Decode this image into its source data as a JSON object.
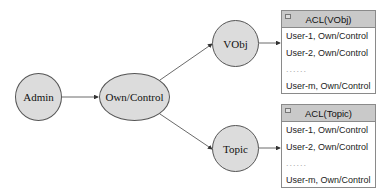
{
  "diagram": {
    "nodes": {
      "admin": "Admin",
      "own_control": "Own/Control",
      "vobj": "VObj",
      "topic": "Topic"
    },
    "edges": [
      {
        "from": "Admin",
        "to": "Own/Control"
      },
      {
        "from": "Own/Control",
        "to": "VObj"
      },
      {
        "from": "Own/Control",
        "to": "Topic"
      },
      {
        "from": "VObj",
        "to": "ACL(VObj)"
      },
      {
        "from": "Topic",
        "to": "ACL(Topic)"
      }
    ],
    "acl_vobj": {
      "title": "ACL(VObj)",
      "rows": [
        "User-1, Own/Control",
        "User-2, Own/Control",
        "......",
        "User-m, Own/Control"
      ]
    },
    "acl_topic": {
      "title": "ACL(Topic)",
      "rows": [
        "User-1, Own/Control",
        "User-2, Own/Control",
        "......",
        "User-m, Own/Control"
      ]
    }
  }
}
